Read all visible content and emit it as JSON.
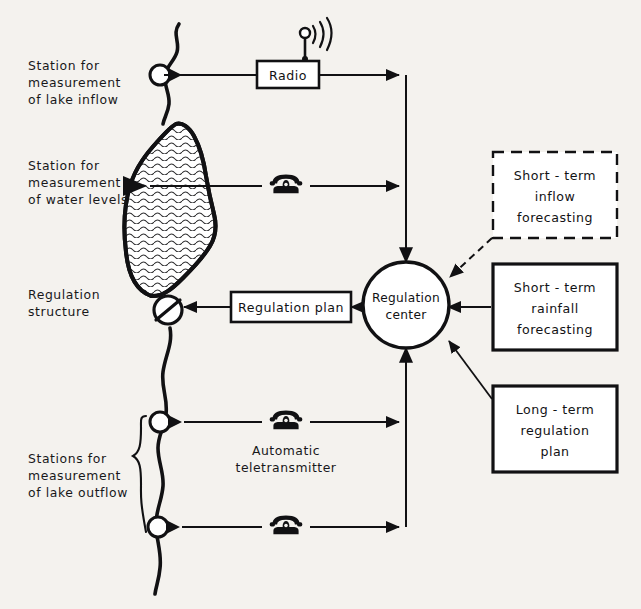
{
  "diagram": {
    "background_color": "#f4f2ee",
    "ink_color": "#111113",
    "left_labels": [
      {
        "id": "inflow-station",
        "lines": [
          "Station for",
          "measurement",
          "of lake inflow"
        ]
      },
      {
        "id": "water-level-station",
        "lines": [
          "Station for",
          "measurement",
          "of water levels"
        ]
      },
      {
        "id": "regulation-structure",
        "lines": [
          "Regulation",
          "structure"
        ]
      },
      {
        "id": "outflow-stations",
        "lines": [
          "Stations for",
          "measurement",
          "of lake outflow"
        ]
      }
    ],
    "nodes": {
      "radio": {
        "label": "Radio",
        "icon": "radio-antenna-icon",
        "border": "solid"
      },
      "regulation_plan": {
        "label": "Regulation plan",
        "border": "solid"
      },
      "regulation_center": {
        "lines": [
          "Regulation",
          "center"
        ],
        "shape": "circle"
      }
    },
    "right_boxes": [
      {
        "id": "short-term-inflow-forecasting",
        "lines": [
          "Short - term",
          "inflow",
          "forecasting"
        ],
        "border": "dashed"
      },
      {
        "id": "short-term-rainfall-forecasting",
        "lines": [
          "Short - term",
          "rainfall",
          "forecasting"
        ],
        "border": "solid"
      },
      {
        "id": "long-term-regulation-plan",
        "lines": [
          "Long - term",
          "regulation",
          "plan"
        ],
        "border": "solid"
      }
    ],
    "telephone_links": [
      {
        "id": "water-level-telephone",
        "icon": "telephone-icon",
        "caption": ""
      },
      {
        "id": "outflow-upper-telephone",
        "icon": "telephone-icon",
        "caption_lines": [
          "Automatic",
          "teletransmitter"
        ]
      },
      {
        "id": "outflow-lower-telephone",
        "icon": "telephone-icon",
        "caption": ""
      }
    ],
    "captions": {
      "automatic_teletransmitter": [
        "Automatic",
        "teletransmitter"
      ]
    }
  }
}
